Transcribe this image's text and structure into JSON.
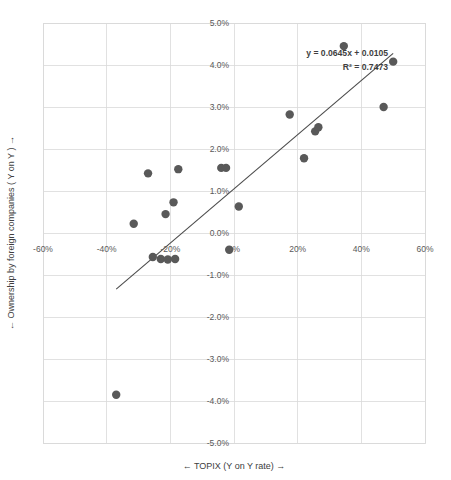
{
  "chart_data": {
    "type": "scatter",
    "title": "",
    "xlabel": "←  TOPIX (Y on Y rate) →",
    "ylabel": "←  Ownership by foreign companies ( Y on Y ) →",
    "xlim": [
      -60,
      60
    ],
    "ylim": [
      -5,
      5
    ],
    "xticks": [
      -60,
      -40,
      -20,
      0,
      20,
      40,
      60
    ],
    "xtick_labels": [
      "-60%",
      "-40%",
      "-20%",
      "0%",
      "20%",
      "40%",
      "60%"
    ],
    "yticks": [
      5,
      4,
      3,
      2,
      1,
      0,
      -1,
      -2,
      -3,
      -4,
      -5
    ],
    "ytick_labels": [
      "5.0%",
      "4.0%",
      "3.0%",
      "2.0%",
      "1.0%",
      "0.0%",
      "-1.0%",
      "-2.0%",
      "-3.0%",
      "-4.0%",
      "-5.0%"
    ],
    "grid": true,
    "legend": false,
    "marker_color": "#595959",
    "trendline_color": "#4a4a4a",
    "gridline_color": "#d9d9d9",
    "points": [
      {
        "x": -37.0,
        "y": -3.85
      },
      {
        "x": -31.5,
        "y": 0.22
      },
      {
        "x": -27.0,
        "y": 1.42
      },
      {
        "x": -25.5,
        "y": -0.57
      },
      {
        "x": -23.0,
        "y": -0.62
      },
      {
        "x": -21.5,
        "y": 0.45
      },
      {
        "x": -20.8,
        "y": -0.63
      },
      {
        "x": -19.0,
        "y": 0.73
      },
      {
        "x": -18.5,
        "y": -0.62
      },
      {
        "x": -17.5,
        "y": 1.52
      },
      {
        "x": -4.0,
        "y": 1.55
      },
      {
        "x": -2.5,
        "y": 1.55
      },
      {
        "x": -1.5,
        "y": -0.4
      },
      {
        "x": 1.5,
        "y": 0.63
      },
      {
        "x": 17.5,
        "y": 2.82
      },
      {
        "x": 22.0,
        "y": 1.78
      },
      {
        "x": 25.5,
        "y": 2.42
      },
      {
        "x": 26.5,
        "y": 2.52
      },
      {
        "x": 34.5,
        "y": 4.45
      },
      {
        "x": 47.0,
        "y": 3.0
      },
      {
        "x": 50.0,
        "y": 4.08
      }
    ],
    "trendline": {
      "equation": "y = 0.0645x + 0.0105",
      "r_squared": "R² = 0.7473",
      "slope": 0.0645,
      "intercept": 0.0105,
      "x_start": -37.0,
      "x_end": 50.0
    }
  },
  "annotations": {
    "equation_label": "y = 0.0645x + 0.0105",
    "r2_label": "R² = 0.7473"
  }
}
